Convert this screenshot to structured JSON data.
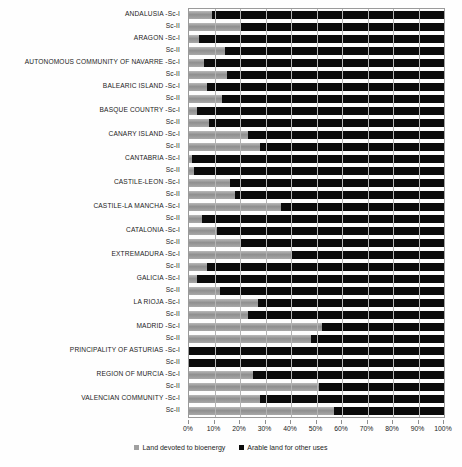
{
  "chart_data": {
    "type": "bar",
    "orientation": "horizontal",
    "stacked": true,
    "normalized_percent": true,
    "title": "",
    "subtitle": "",
    "xlabel": "",
    "ylabel": "",
    "xlim": [
      0,
      100
    ],
    "xticks": [
      "0%",
      "10%",
      "20%",
      "30%",
      "40%",
      "50%",
      "60%",
      "70%",
      "80%",
      "90%",
      "100%"
    ],
    "xtick_values": [
      0,
      10,
      20,
      30,
      40,
      50,
      60,
      70,
      80,
      90,
      100
    ],
    "grid": true,
    "legend_position": "bottom-center",
    "legend": [
      {
        "label": "Land devoted to bioenergy",
        "color": "#a0a0a0",
        "marker": "square"
      },
      {
        "label": "Arable land for other uses",
        "color": "#0b0b0b",
        "marker": "square"
      }
    ],
    "series": [
      {
        "name": "Land devoted to bioenergy",
        "color": "#a0a0a0"
      },
      {
        "name": "Arable land for other uses",
        "color": "#0b0b0b"
      }
    ],
    "categories": [
      "ANDALUSIA -Sc-I",
      "Sc-II",
      "ARAGON -Sc-I",
      "Sc-II",
      "AUTONOMOUS COMMUNITY OF NAVARRE -Sc-I",
      "Sc-II",
      "BALEARIC ISLAND -Sc-I",
      "Sc-II",
      "BASQUE COUNTRY -Sc-I",
      "Sc-II",
      "CANARY ISLAND -Sc-I",
      "Sc-II",
      "CANTABRIA -Sc-I",
      "Sc-II",
      "CASTILE-LEON -Sc-I",
      "Sc-II",
      "CASTILE-LA MANCHA -Sc-I",
      "Sc-II",
      "CATALONIA -Sc-I",
      "Sc-II",
      "EXTREMADURA -Sc-I",
      "Sc-II",
      "GALICIA -Sc-I",
      "Sc-II",
      "LA RIOJA -Sc-I",
      "Sc-II",
      "MADRID -Sc-I",
      "Sc-II",
      "PRINCIPALITY OF ASTURIAS -Sc-I",
      "Sc-II",
      "REGION OF MURCIA -Sc-I",
      "Sc-II",
      "VALENCIAN COMMUNITY -Sc-I",
      "Sc-II"
    ],
    "rows": [
      {
        "region": "ANDALUSIA",
        "scenario": "Sc-I",
        "label": "ANDALUSIA -Sc-I",
        "bioenergy": 9,
        "arable": 91
      },
      {
        "region": "ANDALUSIA",
        "scenario": "Sc-II",
        "label": "Sc-II",
        "bioenergy": 20,
        "arable": 80
      },
      {
        "region": "ARAGON",
        "scenario": "Sc-I",
        "label": "ARAGON -Sc-I",
        "bioenergy": 4,
        "arable": 96
      },
      {
        "region": "ARAGON",
        "scenario": "Sc-II",
        "label": "Sc-II",
        "bioenergy": 14,
        "arable": 86
      },
      {
        "region": "AUTONOMOUS COMMUNITY OF NAVARRE",
        "scenario": "Sc-I",
        "label": "AUTONOMOUS COMMUNITY OF NAVARRE -Sc-I",
        "bioenergy": 6,
        "arable": 94
      },
      {
        "region": "AUTONOMOUS COMMUNITY OF NAVARRE",
        "scenario": "Sc-II",
        "label": "Sc-II",
        "bioenergy": 15,
        "arable": 85
      },
      {
        "region": "BALEARIC ISLAND",
        "scenario": "Sc-I",
        "label": "BALEARIC ISLAND -Sc-I",
        "bioenergy": 7,
        "arable": 93
      },
      {
        "region": "BALEARIC ISLAND",
        "scenario": "Sc-II",
        "label": "Sc-II",
        "bioenergy": 13,
        "arable": 87
      },
      {
        "region": "BASQUE COUNTRY",
        "scenario": "Sc-I",
        "label": "BASQUE COUNTRY -Sc-I",
        "bioenergy": 3,
        "arable": 97
      },
      {
        "region": "BASQUE COUNTRY",
        "scenario": "Sc-II",
        "label": "Sc-II",
        "bioenergy": 8,
        "arable": 92
      },
      {
        "region": "CANARY ISLAND",
        "scenario": "Sc-I",
        "label": "CANARY ISLAND -Sc-I",
        "bioenergy": 23,
        "arable": 77
      },
      {
        "region": "CANARY ISLAND",
        "scenario": "Sc-II",
        "label": "Sc-II",
        "bioenergy": 28,
        "arable": 72
      },
      {
        "region": "CANTABRIA",
        "scenario": "Sc-I",
        "label": "CANTABRIA -Sc-I",
        "bioenergy": 1,
        "arable": 99
      },
      {
        "region": "CANTABRIA",
        "scenario": "Sc-II",
        "label": "Sc-II",
        "bioenergy": 2,
        "arable": 98
      },
      {
        "region": "CASTILE-LEON",
        "scenario": "Sc-I",
        "label": "CASTILE-LEON -Sc-I",
        "bioenergy": 16,
        "arable": 84
      },
      {
        "region": "CASTILE-LEON",
        "scenario": "Sc-II",
        "label": "Sc-II",
        "bioenergy": 18,
        "arable": 82
      },
      {
        "region": "CASTILE-LA MANCHA",
        "scenario": "Sc-I",
        "label": "CASTILE-LA MANCHA -Sc-I",
        "bioenergy": 36,
        "arable": 64
      },
      {
        "region": "CASTILE-LA MANCHA",
        "scenario": "Sc-II",
        "label": "Sc-II",
        "bioenergy": 5,
        "arable": 95
      },
      {
        "region": "CATALONIA",
        "scenario": "Sc-I",
        "label": "CATALONIA -Sc-I",
        "bioenergy": 11,
        "arable": 89
      },
      {
        "region": "CATALONIA",
        "scenario": "Sc-II",
        "label": "Sc-II",
        "bioenergy": 20,
        "arable": 80
      },
      {
        "region": "EXTREMADURA",
        "scenario": "Sc-I",
        "label": "EXTREMADURA -Sc-I",
        "bioenergy": 40,
        "arable": 60
      },
      {
        "region": "EXTREMADURA",
        "scenario": "Sc-II",
        "label": "Sc-II",
        "bioenergy": 7,
        "arable": 93
      },
      {
        "region": "GALICIA",
        "scenario": "Sc-I",
        "label": "GALICIA -Sc-I",
        "bioenergy": 3,
        "arable": 97
      },
      {
        "region": "GALICIA",
        "scenario": "Sc-II",
        "label": "Sc-II",
        "bioenergy": 12,
        "arable": 88
      },
      {
        "region": "LA RIOJA",
        "scenario": "Sc-I",
        "label": "LA RIOJA -Sc-I",
        "bioenergy": 27,
        "arable": 73
      },
      {
        "region": "LA RIOJA",
        "scenario": "Sc-II",
        "label": "Sc-II",
        "bioenergy": 23,
        "arable": 77
      },
      {
        "region": "MADRID",
        "scenario": "Sc-I",
        "label": "MADRID -Sc-I",
        "bioenergy": 52,
        "arable": 48
      },
      {
        "region": "MADRID",
        "scenario": "Sc-II",
        "label": "Sc-II",
        "bioenergy": 48,
        "arable": 52
      },
      {
        "region": "PRINCIPALITY OF ASTURIAS",
        "scenario": "Sc-I",
        "label": "PRINCIPALITY OF ASTURIAS -Sc-I",
        "bioenergy": 0,
        "arable": 100
      },
      {
        "region": "PRINCIPALITY OF ASTURIAS",
        "scenario": "Sc-II",
        "label": "Sc-II",
        "bioenergy": 0,
        "arable": 100
      },
      {
        "region": "REGION OF MURCIA",
        "scenario": "Sc-I",
        "label": "REGION OF MURCIA -Sc-I",
        "bioenergy": 25,
        "arable": 75
      },
      {
        "region": "REGION OF MURCIA",
        "scenario": "Sc-II",
        "label": "Sc-II",
        "bioenergy": 51,
        "arable": 49
      },
      {
        "region": "VALENCIAN COMMUNITY",
        "scenario": "Sc-I",
        "label": "VALENCIAN COMMUNITY -Sc-I",
        "bioenergy": 28,
        "arable": 72
      },
      {
        "region": "VALENCIAN COMMUNITY",
        "scenario": "Sc-II",
        "label": "Sc-II",
        "bioenergy": 57,
        "arable": 43
      }
    ]
  }
}
